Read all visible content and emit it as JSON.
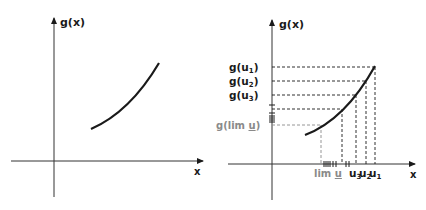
{
  "left_graph": {
    "y_axis_label": "g(x)",
    "x_axis_label": "x"
  },
  "right_graph": {
    "y_axis_label": "g(x)",
    "x_axis_label": "x",
    "y_labels": {
      "g_u1": "g(u",
      "g_u1_sub": "1",
      "g_u2": "g(u",
      "g_u2_sub": "2",
      "g_u3": "g(u",
      "g_u3_sub": "3",
      "close": ")",
      "g_lim": "g(lim ",
      "g_lim_u": "u",
      "g_lim_close": ")"
    },
    "x_labels": {
      "lim": "lim ",
      "lim_u": "u",
      "u3": "u",
      "u3_sub": "3",
      "u2": "u",
      "u2_sub": "2",
      "u1": "u",
      "u1_sub": "1"
    }
  },
  "colors": {
    "ink": "#1a1a1a",
    "limit_gray": "#8a8a8a"
  }
}
